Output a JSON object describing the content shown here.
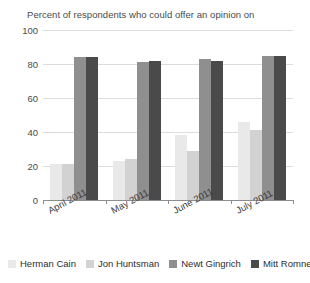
{
  "chart_data": {
    "type": "bar",
    "title": "Percent of respondents who could offer an opinion on",
    "xlabel": "",
    "ylabel": "",
    "ylim": [
      0,
      100
    ],
    "yticks": [
      0,
      20,
      40,
      60,
      80,
      100
    ],
    "grid": true,
    "legend_position": "bottom",
    "categories": [
      "April 2011",
      "May 2011",
      "June 2011",
      "July 2011"
    ],
    "series": [
      {
        "name": "Herman Cain",
        "color": "#e9e9e9",
        "values": [
          21,
          23,
          38,
          46
        ]
      },
      {
        "name": "Jon Huntsman",
        "color": "#d2d2d2",
        "values": [
          21,
          24,
          29,
          41
        ]
      },
      {
        "name": "Newt Gingrich",
        "color": "#8f8f8f",
        "values": [
          84,
          81,
          83,
          85
        ]
      },
      {
        "name": "Mitt Romney",
        "color": "#4a4a4a",
        "values": [
          84,
          82,
          82,
          85
        ]
      }
    ]
  }
}
